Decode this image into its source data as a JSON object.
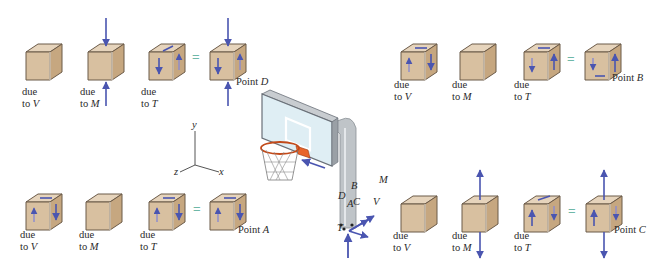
{
  "figure": {
    "colors": {
      "cube_front": "#d8c0a0",
      "cube_side": "#c9ab86",
      "cube_top": "#e6d4bc",
      "cube_edge": "#6b5a48",
      "arrow": "#4a55b0",
      "equals": "#6fb8a8",
      "pole": "#bfc4c8",
      "rim": "#e8642a"
    },
    "groups": [
      {
        "id": "D",
        "point_label": "Point",
        "point_letter": "D",
        "items": [
          {
            "line1": "due",
            "line2_prefix": "to ",
            "line2_var": "V"
          },
          {
            "line1": "due",
            "line2_prefix": "to ",
            "line2_var": "M"
          },
          {
            "line1": "due",
            "line2_prefix": "to ",
            "line2_var": "T"
          }
        ],
        "equals": "="
      },
      {
        "id": "B",
        "point_label": "Point",
        "point_letter": "B",
        "items": [
          {
            "line1": "due",
            "line2_prefix": "to ",
            "line2_var": "V"
          },
          {
            "line1": "due",
            "line2_prefix": "to ",
            "line2_var": "M"
          },
          {
            "line1": "due",
            "line2_prefix": "to ",
            "line2_var": "T"
          }
        ],
        "equals": "="
      },
      {
        "id": "A",
        "point_label": "Point",
        "point_letter": "A",
        "items": [
          {
            "line1": "due",
            "line2_prefix": "to ",
            "line2_var": "V"
          },
          {
            "line1": "due",
            "line2_prefix": "to ",
            "line2_var": "M"
          },
          {
            "line1": "due",
            "line2_prefix": "to ",
            "line2_var": "T"
          }
        ],
        "equals": "="
      },
      {
        "id": "C",
        "point_label": "Point",
        "point_letter": "C",
        "items": [
          {
            "line1": "due",
            "line2_prefix": "to ",
            "line2_var": "V"
          },
          {
            "line1": "due",
            "line2_prefix": "to ",
            "line2_var": "M"
          },
          {
            "line1": "due",
            "line2_prefix": "to ",
            "line2_var": "T"
          }
        ],
        "equals": "="
      }
    ],
    "axes": {
      "y": "y",
      "x": "x",
      "z": "z"
    },
    "hoop_labels": {
      "D": "D",
      "A": "A",
      "B": "B",
      "C": "C",
      "M": "M",
      "V": "V",
      "T": "T"
    }
  }
}
